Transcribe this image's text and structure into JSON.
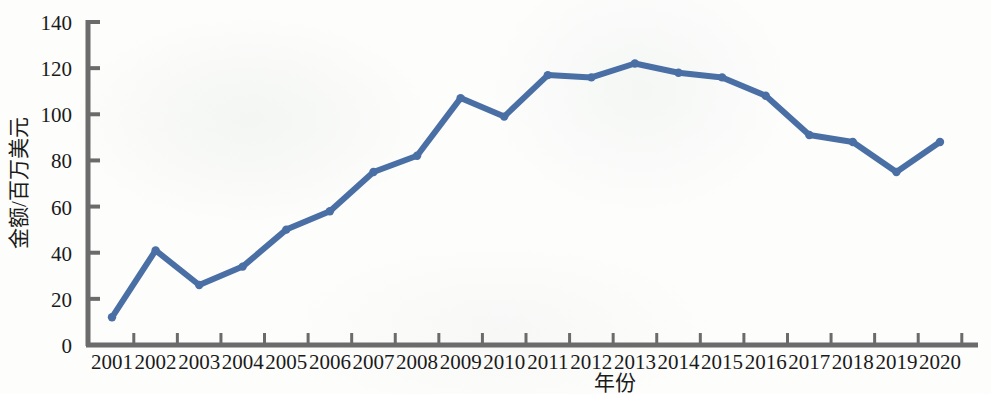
{
  "chart_data": {
    "type": "line",
    "title": "",
    "xlabel": "年份",
    "ylabel": "金额/百万美元",
    "categories": [
      "2001",
      "2002",
      "2003",
      "2004",
      "2005",
      "2006",
      "2007",
      "2008",
      "2009",
      "2010",
      "2011",
      "2012",
      "2013",
      "2014",
      "2015",
      "2016",
      "2017",
      "2018",
      "2019",
      "2020"
    ],
    "values": [
      12,
      41,
      26,
      34,
      50,
      58,
      75,
      82,
      107,
      99,
      117,
      116,
      122,
      118,
      116,
      108,
      91,
      88,
      75,
      88
    ],
    "series": [
      {
        "name": "金额",
        "values": [
          12,
          41,
          26,
          34,
          50,
          58,
          75,
          82,
          107,
          99,
          117,
          116,
          122,
          118,
          116,
          108,
          91,
          88,
          75,
          88
        ]
      }
    ],
    "ylim": [
      0,
      140
    ],
    "ytick_labels": [
      "0",
      "20",
      "40",
      "60",
      "80",
      "100",
      "120",
      "140"
    ],
    "ytick_values": [
      0,
      20,
      40,
      60,
      80,
      100,
      120,
      140
    ],
    "grid": false,
    "legend": false,
    "legend_position": "none",
    "line_color": "#4a6fa5",
    "marker_color": "#4a6fa5",
    "axis_color": "#6b6b6b",
    "text_color": "#1a1a1a"
  }
}
